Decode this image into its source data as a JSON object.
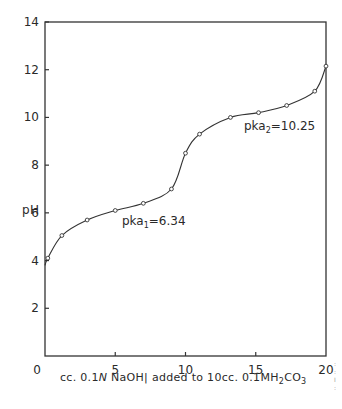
{
  "chart_data": {
    "type": "line",
    "title": "",
    "xlabel": "cc. 0.1N NaOH added to 10cc. 0.1M H2CO3",
    "ylabel": "pH",
    "xlim": [
      0,
      20
    ],
    "ylim": [
      0,
      14
    ],
    "x_ticks": [
      0,
      5,
      10,
      15,
      20
    ],
    "y_ticks": [
      2,
      4,
      6,
      8,
      10,
      12,
      14
    ],
    "y_tick_labels": [
      "2",
      "4",
      "6",
      "8",
      "10",
      "12",
      "14"
    ],
    "x_tick_labels": [
      "0",
      "5",
      "10",
      "15",
      "20"
    ],
    "grid": false,
    "legend": null,
    "series": [
      {
        "name": "titration curve",
        "marker": "open-circle",
        "x": [
          0.0,
          0.2,
          1.2,
          3.0,
          5.0,
          7.0,
          9.0,
          10.0,
          11.0,
          13.2,
          15.2,
          17.2,
          19.2,
          20.0
        ],
        "y": [
          3.8,
          4.1,
          5.05,
          5.7,
          6.1,
          6.4,
          7.0,
          8.5,
          9.3,
          10.0,
          10.2,
          10.5,
          11.1,
          12.15
        ]
      }
    ],
    "annotations": [
      {
        "text_main": "pka",
        "subscript": "1",
        "value": "=6.34",
        "x": 8.4,
        "y": 5.5
      },
      {
        "text_main": "pka",
        "subscript": "2",
        "value": "=10.25",
        "x": 14.0,
        "y": 9.35
      }
    ]
  },
  "labels": {
    "ylabel": "pH",
    "xlabel_prefix": "cc. 0.1",
    "xlabel_N": "N",
    "xlabel_mid": " NaOH| added to 10cc. 0.1MH",
    "xlabel_sub2": "2",
    "xlabel_co": "CO",
    "xlabel_sub3": "3",
    "pka1_main": "pka",
    "pka1_sub": "1",
    "pka1_val": "=6.34",
    "pka2_main": "pka",
    "pka2_sub": "2",
    "pka2_val": "=10.25"
  }
}
